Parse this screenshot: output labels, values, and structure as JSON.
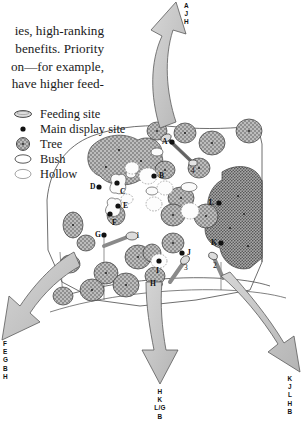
{
  "figure": {
    "kind": "hand-drawn study-site map with migration arrows",
    "palette": {
      "ink": "#1a1a1a",
      "arrow_fill": "#c9c9c9",
      "arrow_stroke": "#555555",
      "tree_fill": "#9a9a9a",
      "tree_stroke": "#3a3a3a",
      "bush_stroke": "#555555",
      "hollow_stroke": "#888888",
      "feeding_fill": "#d8d8d8",
      "boundary_stroke": "#444444",
      "paper": "#ffffff"
    }
  },
  "body_text": {
    "lines": [
      "ies, high-ranking",
      "benefits. Priority",
      "on—for example,",
      "have higher feed-"
    ]
  },
  "legend": {
    "items": [
      {
        "icon": "feeding-site-oval-icon",
        "label": "Feeding site"
      },
      {
        "icon": "main-display-site-dot-icon",
        "label": "Main display site"
      },
      {
        "icon": "tree-stippled-circle-icon",
        "label": "Tree"
      },
      {
        "icon": "bush-outline-oval-icon",
        "label": "Bush"
      },
      {
        "icon": "hollow-outline-oval-icon",
        "label": "Hollow"
      }
    ]
  },
  "arrows": [
    {
      "name": "top-arrow",
      "direction": "up",
      "labels": [
        "A",
        "J",
        "H"
      ]
    },
    {
      "name": "bottom-left-arrow",
      "direction": "down-left",
      "labels": [
        "F",
        "E",
        "G",
        "B",
        "H"
      ]
    },
    {
      "name": "bottom-center-arrow",
      "direction": "down",
      "labels": [
        "H",
        "K",
        "L/G",
        "B"
      ]
    },
    {
      "name": "bottom-right-arrow",
      "direction": "down-right",
      "labels": [
        "K",
        "J",
        "L",
        "H",
        "B"
      ]
    }
  ],
  "map_labels": {
    "display_sites": [
      {
        "id": "A",
        "x": 163,
        "y": 142
      },
      {
        "id": "B",
        "x": 148,
        "y": 176
      },
      {
        "id": "C",
        "x": 121,
        "y": 188
      },
      {
        "id": "D",
        "x": 91,
        "y": 187
      },
      {
        "id": "E",
        "x": 124,
        "y": 206
      },
      {
        "id": "F",
        "x": 113,
        "y": 218
      },
      {
        "id": "G",
        "x": 96,
        "y": 235
      },
      {
        "id": "H",
        "x": 152,
        "y": 284
      },
      {
        "id": "I",
        "x": 161,
        "y": 261
      },
      {
        "id": "J",
        "x": 188,
        "y": 253
      },
      {
        "id": "K",
        "x": 215,
        "y": 243
      },
      {
        "id": "L",
        "x": 212,
        "y": 203
      }
    ],
    "feeding_sites": [
      {
        "id": "1",
        "x": 132,
        "y": 236
      },
      {
        "id": "2",
        "x": 214,
        "y": 259
      },
      {
        "id": "3",
        "x": 185,
        "y": 262
      },
      {
        "id": "4",
        "x": 192,
        "y": 163
      }
    ]
  }
}
